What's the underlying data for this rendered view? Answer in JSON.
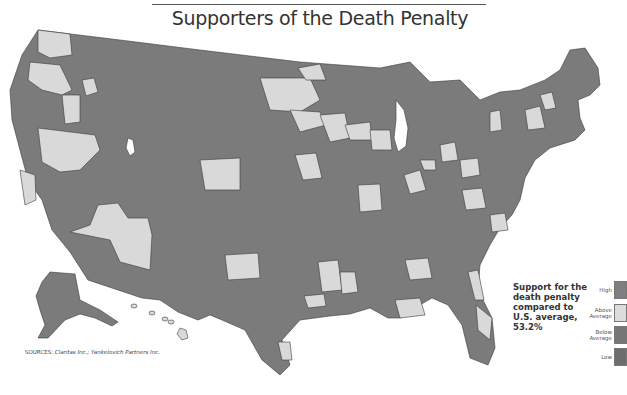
{
  "title": "Supporters of the Death Penalty",
  "caption": "Support for the death penalty compared to U.S. average, 53.2%",
  "sources": {
    "label": "SOURCES:",
    "text": "Claritas Inc.; Yankelovich Partners Inc."
  },
  "legend": {
    "items": [
      {
        "label": "High",
        "color": "#7e7e7e"
      },
      {
        "label": "Above Average",
        "color": "#dcdcdc"
      },
      {
        "label": "Below Average",
        "color": "#777777"
      },
      {
        "label": "Low",
        "color": "#6d6d6d"
      }
    ]
  },
  "map": {
    "us_average_percent": 53.2,
    "colors": {
      "dark": "#7b7b7b",
      "light": "#d9d9d9",
      "border": "#3a3a3a",
      "water": "#ffffff"
    }
  }
}
